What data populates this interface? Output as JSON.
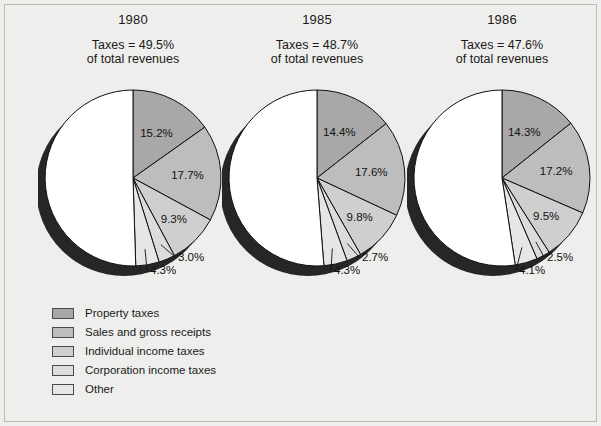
{
  "figure": {
    "background_color": "#eeeeec",
    "border_color": "#b9b9b6"
  },
  "chart_data": {
    "type": "pie",
    "title": "",
    "subtitle": "",
    "legend_position": "bottom-left",
    "categories": [
      "Property taxes",
      "Sales and gross receipts",
      "Individual income taxes",
      "Corporation income taxes",
      "Other",
      "Nontax revenues"
    ],
    "category_colors": [
      "#a8a8a8",
      "#bdbdbd",
      "#cfcfcf",
      "#dcdcdc",
      "#e6e6e6",
      "#ffffff"
    ],
    "panels": [
      {
        "year": "1980",
        "note_line1": "Taxes = 49.5%",
        "note_line2": "of total revenues",
        "taxes_share": 49.5,
        "values": [
          15.2,
          17.7,
          9.3,
          3.0,
          4.3,
          50.5
        ],
        "labels": [
          "15.2%",
          "17.7%",
          "9.3%",
          "3.0%",
          "4.3%"
        ]
      },
      {
        "year": "1985",
        "note_line1": "Taxes = 48.7%",
        "note_line2": "of total revenues",
        "taxes_share": 48.7,
        "values": [
          14.4,
          17.6,
          9.8,
          2.7,
          4.3,
          51.3
        ],
        "labels": [
          "14.4%",
          "17.6%",
          "9.8%",
          "2.7%",
          "4.3%"
        ]
      },
      {
        "year": "1986",
        "note_line1": "Taxes = 47.6%",
        "note_line2": "of total revenues",
        "taxes_share": 47.6,
        "values": [
          14.3,
          17.2,
          9.5,
          2.5,
          4.1,
          52.4
        ],
        "labels": [
          "14.3%",
          "17.2%",
          "9.5%",
          "2.5%",
          "4.1%"
        ]
      }
    ]
  },
  "legend": {
    "items": [
      {
        "label": "Property taxes",
        "color": "#a8a8a8"
      },
      {
        "label": "Sales and gross receipts",
        "color": "#bdbdbd"
      },
      {
        "label": "Individual income taxes",
        "color": "#cfcfcf"
      },
      {
        "label": "Corporation income taxes",
        "color": "#dcdcdc"
      },
      {
        "label": "Other",
        "color": "#e6e6e6"
      }
    ]
  }
}
